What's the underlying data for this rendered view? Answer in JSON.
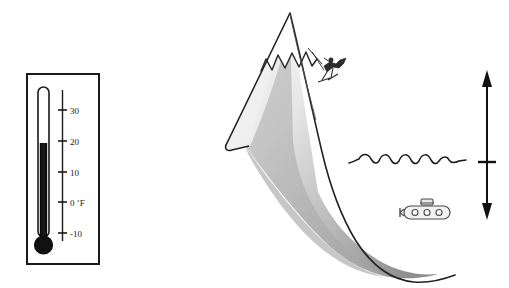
{
  "figure": {
    "background_color": "#ffffff",
    "ink_color": "#1a1a1a"
  },
  "thermometer": {
    "name": "Fahrenheit thermometer",
    "unit_label": "˚F",
    "current_reading": 15,
    "scale_min": -10,
    "scale_max": 30,
    "frame_color": "#1a1a1a",
    "mercury_color": "#111111",
    "ticks": [
      {
        "value": 30,
        "label": "30"
      },
      {
        "value": 20,
        "label": "20"
      },
      {
        "value": 10,
        "label": "10"
      },
      {
        "value": 0,
        "label": "0"
      },
      {
        "value": -10,
        "label": "-10"
      }
    ],
    "zero_label": "0  ˚F"
  },
  "iceberg": {
    "name": "iceberg",
    "peak_label": "",
    "snowcap_color": "#ffffff",
    "body_gradient_top": "#ffffff",
    "body_gradient_mid": "#c9c9c9",
    "body_gradient_bottom": "#8e8e8e",
    "outline_color": "#222222"
  },
  "climber": {
    "name": "climber on slope",
    "color": "#2b2b2b"
  },
  "water": {
    "name": "water surface line",
    "wave_count": 5,
    "line_color": "#1a1a1a"
  },
  "submarine": {
    "name": "submarine",
    "porthole_count": 3,
    "body_color": "#f2f2f2",
    "outline_color": "#4a4a4a"
  },
  "depth_arrow": {
    "name": "depth indicator arrow",
    "label": "",
    "color": "#111111",
    "has_waterline_tick": true
  }
}
